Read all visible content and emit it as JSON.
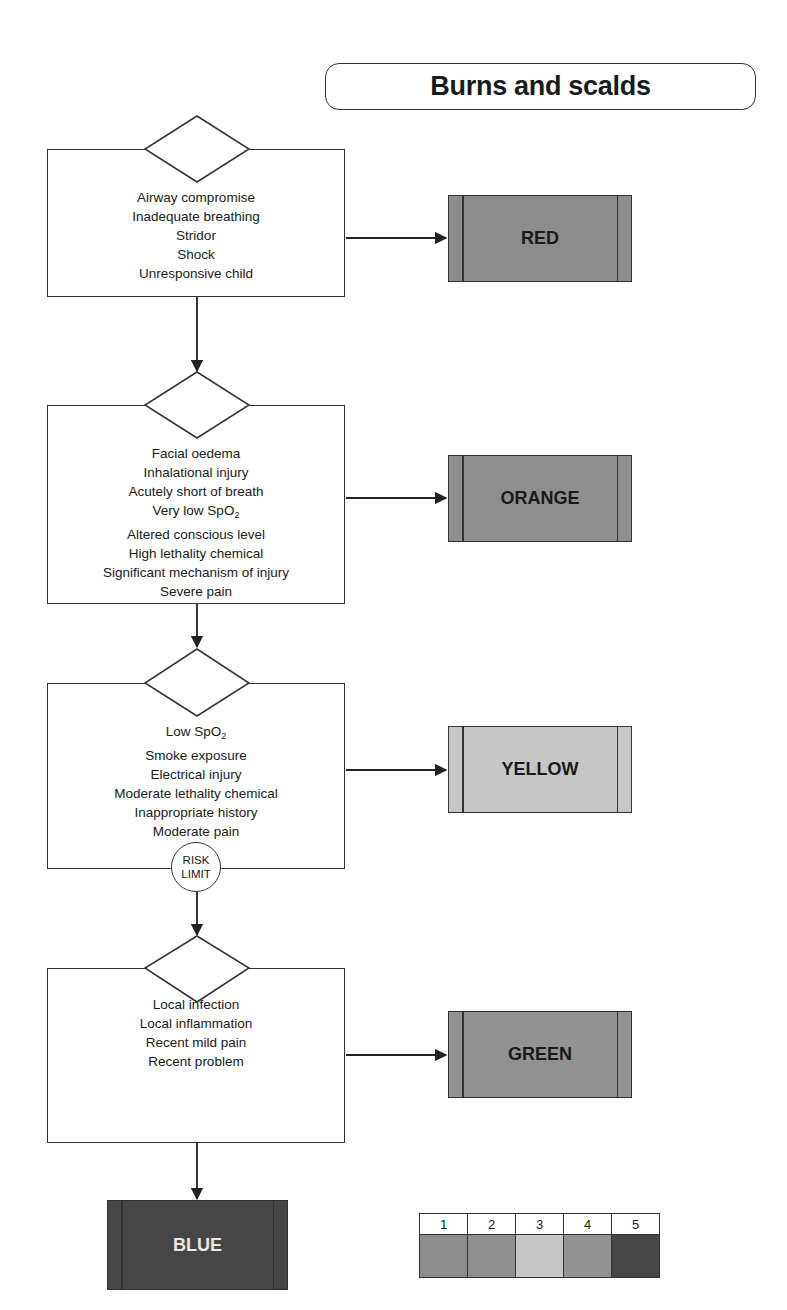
{
  "title": "Burns and scalds",
  "colors": {
    "red": "#8c8c8c",
    "orange": "#8e8e8e",
    "yellow": "#c6c6c6",
    "green": "#929292",
    "blue": "#464646",
    "line": "#333333"
  },
  "steps": [
    {
      "criteria": [
        "Airway compromise",
        "Inadequate breathing",
        "Stridor",
        "Shock",
        "Unresponsive child"
      ],
      "outcome": "RED"
    },
    {
      "criteria": [
        "Facial oedema",
        "Inhalational injury",
        "Acutely short of breath",
        "Very low SpO2",
        "Altered conscious level",
        "High lethality chemical",
        "Significant mechanism of injury",
        "Severe pain"
      ],
      "outcome": "ORANGE"
    },
    {
      "criteria": [
        "Low SpO2",
        "Smoke exposure",
        "Electrical injury",
        "Moderate lethality chemical",
        "Inappropriate history",
        "Moderate pain"
      ],
      "outcome": "YELLOW"
    },
    {
      "criteria": [
        "Local infection",
        "Local inflammation",
        "Recent mild pain",
        "Recent problem"
      ],
      "outcome": "GREEN"
    }
  ],
  "risk_limit": {
    "line1": "RISK",
    "line2": "LIMIT"
  },
  "final_outcome": "BLUE",
  "legend": {
    "numbers": [
      "1",
      "2",
      "3",
      "4",
      "5"
    ],
    "swatches": [
      "#8c8c8c",
      "#8e8e8e",
      "#c6c6c6",
      "#929292",
      "#464646"
    ]
  }
}
